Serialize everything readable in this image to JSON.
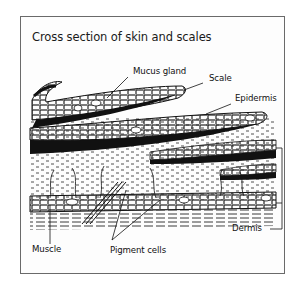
{
  "title": "Cross section of skin and scales",
  "labels": {
    "mucus_gland": "Mucus gland",
    "scale": "Scale",
    "epidermis": "Epidermis",
    "dermis": "Dermis",
    "muscle": "Muscle",
    "pigment_cells": "Pigment cells"
  },
  "colors": {
    "ink": "#111111",
    "frame": "#6a6a6a",
    "background": "#ffffff"
  }
}
